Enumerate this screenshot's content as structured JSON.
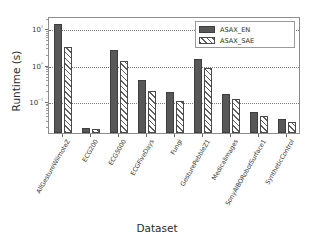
{
  "chart_data": {
    "type": "bar",
    "title": "",
    "xlabel": "Dataset",
    "ylabel": "Runtime (s)",
    "yscale": "log",
    "ylim": [
      0.013,
      22
    ],
    "grid": true,
    "legend_position": "upper right",
    "ytick_labels": [
      "10¹",
      "10⁰",
      "10⁻¹"
    ],
    "ytick_values": [
      10,
      1,
      0.1
    ],
    "categories": [
      "AllGestureWiimoteZ",
      "ECG200",
      "ECG5000",
      "ECGFiveDays",
      "Fungi",
      "GesturePebbleZ1",
      "MedicalImages",
      "SonyAIBORobotSurface1",
      "SyntheticControl"
    ],
    "series": [
      {
        "name": "ASAX_EN",
        "color": "#585858",
        "pattern": "solid",
        "values": [
          13.0,
          0.0175,
          2.6,
          0.37,
          0.175,
          1.4,
          0.155,
          0.048,
          0.031
        ]
      },
      {
        "name": "ASAX_SAE",
        "color": "#ffffff",
        "pattern": "diagonal-hatch",
        "values": [
          3.1,
          0.0168,
          1.3,
          0.19,
          0.097,
          0.79,
          0.112,
          0.038,
          0.026
        ]
      }
    ]
  },
  "legend": {
    "entries": [
      {
        "label": "ASAX_EN"
      },
      {
        "label": "ASAX_SAE"
      }
    ]
  }
}
